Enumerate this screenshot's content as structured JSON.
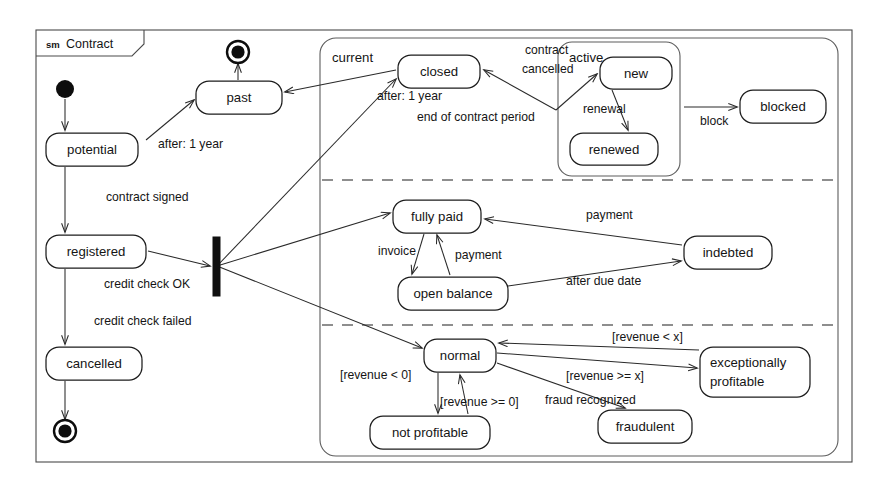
{
  "frame": {
    "kind": "sm",
    "name": "Contract",
    "x": 36,
    "y": 30,
    "w": 816,
    "h": 432,
    "tab_w": 108,
    "tab_h": 26
  },
  "composite": {
    "name": "current",
    "name_x": 332,
    "name_y": 62,
    "x": 320,
    "y": 38,
    "w": 518,
    "h": 418,
    "dividers": [
      180,
      325
    ]
  },
  "active_region": {
    "name": "active",
    "name_x": 569,
    "name_y": 62,
    "x": 558,
    "y": 42,
    "w": 122,
    "h": 134
  },
  "pseudostates": [
    {
      "name": "initial-node",
      "kind": "initial",
      "cx": 65,
      "cy": 89,
      "r": 9
    },
    {
      "name": "final-node-past",
      "kind": "final",
      "cx": 238,
      "cy": 52,
      "r": 11
    },
    {
      "name": "final-node-cancelled",
      "kind": "final",
      "cx": 65,
      "cy": 431,
      "r": 11
    },
    {
      "name": "fork-bar",
      "kind": "fork",
      "x": 213,
      "y": 237,
      "w": 7,
      "h": 59
    }
  ],
  "states": [
    {
      "id": "past",
      "label": "past",
      "x": 196,
      "y": 81,
      "w": 86,
      "h": 33
    },
    {
      "id": "potential",
      "label": "potential",
      "x": 46,
      "y": 133,
      "w": 92,
      "h": 33
    },
    {
      "id": "registered",
      "label": "registered",
      "x": 46,
      "y": 235,
      "w": 100,
      "h": 33
    },
    {
      "id": "cancelled",
      "label": "cancelled",
      "x": 46,
      "y": 347,
      "w": 96,
      "h": 33
    },
    {
      "id": "closed",
      "label": "closed",
      "x": 398,
      "y": 55,
      "w": 82,
      "h": 33
    },
    {
      "id": "new",
      "label": "new",
      "x": 600,
      "y": 57,
      "w": 72,
      "h": 32
    },
    {
      "id": "renewed",
      "label": "renewed",
      "x": 570,
      "y": 133,
      "w": 88,
      "h": 32
    },
    {
      "id": "blocked",
      "label": "blocked",
      "x": 740,
      "y": 90,
      "w": 86,
      "h": 33
    },
    {
      "id": "fully_paid",
      "label": "fully paid",
      "x": 393,
      "y": 200,
      "w": 88,
      "h": 33
    },
    {
      "id": "open_balance",
      "label": "open balance",
      "x": 398,
      "y": 277,
      "w": 110,
      "h": 33
    },
    {
      "id": "indebted",
      "label": "indebted",
      "x": 684,
      "y": 236,
      "w": 88,
      "h": 33
    },
    {
      "id": "normal",
      "label": "normal",
      "x": 424,
      "y": 339,
      "w": 72,
      "h": 33
    },
    {
      "id": "not_profitable",
      "label": "not profitable",
      "x": 370,
      "y": 416,
      "w": 120,
      "h": 33
    },
    {
      "id": "fraudulent",
      "label": "fraudulent",
      "x": 598,
      "y": 410,
      "w": 94,
      "h": 33
    },
    {
      "id": "exceptionally_profitable",
      "label_line1": "exceptionally",
      "label_line2": "profitable",
      "x": 700,
      "y": 347,
      "w": 110,
      "h": 50
    }
  ],
  "transition_labels": [
    {
      "id": "after_1_year",
      "text": "after: 1 year",
      "x": 158,
      "y": 148
    },
    {
      "id": "contract_signed",
      "text": "contract signed",
      "x": 106,
      "y": 201
    },
    {
      "id": "credit_check_ok",
      "text": "credit check OK",
      "x": 104,
      "y": 288
    },
    {
      "id": "credit_check_failed",
      "text": "credit check failed",
      "x": 94,
      "y": 325
    },
    {
      "id": "after_1_year_current",
      "text": "after: 1 year",
      "x": 377,
      "y": 100
    },
    {
      "id": "end_of_contract_period",
      "text": "end of contract period",
      "x": 417,
      "y": 121
    },
    {
      "id": "contract",
      "text": "contract",
      "x": 525,
      "y": 54
    },
    {
      "id": "cancelled_evt",
      "text": "cancelled",
      "x": 522,
      "y": 73
    },
    {
      "id": "renewal",
      "text": "renewal",
      "x": 583,
      "y": 113
    },
    {
      "id": "block",
      "text": "block",
      "x": 700,
      "y": 125
    },
    {
      "id": "invoice",
      "text": "invoice",
      "x": 378,
      "y": 255
    },
    {
      "id": "payment_ob",
      "text": "payment",
      "x": 455,
      "y": 259
    },
    {
      "id": "payment_ind",
      "text": "payment",
      "x": 586,
      "y": 219
    },
    {
      "id": "after_due_date",
      "text": "after due date",
      "x": 566,
      "y": 285
    },
    {
      "id": "revenue_lt_0",
      "text": "[revenue < 0]",
      "x": 340,
      "y": 379
    },
    {
      "id": "revenue_gte_0",
      "text": "[revenue >= 0]",
      "x": 440,
      "y": 406
    },
    {
      "id": "revenue_lt_x",
      "text": "[revenue < x]",
      "x": 612,
      "y": 341
    },
    {
      "id": "revenue_gte_x",
      "text": "[revenue >= x]",
      "x": 566,
      "y": 380
    },
    {
      "id": "fraud_recognized",
      "text": "fraud recognized",
      "x": 545,
      "y": 404
    }
  ],
  "edges": [
    {
      "id": "initial-to-potential",
      "d": "M 65 99 L 65 130",
      "arrow": true
    },
    {
      "id": "potential-to-past",
      "d": "M 146 140 L 194 100",
      "arrow": true
    },
    {
      "id": "potential-to-registered",
      "d": "M 65 167 L 65 232",
      "arrow": true
    },
    {
      "id": "past-to-final",
      "d": "M 238 80 L 238 64",
      "arrow": true
    },
    {
      "id": "registered-to-cancelled",
      "d": "M 65 269 L 65 344",
      "arrow": true
    },
    {
      "id": "cancelled-to-final",
      "d": "M 65 381 L 65 419",
      "arrow": true
    },
    {
      "id": "registered-to-fork",
      "d": "M 148 251 L 210 266",
      "arrow": true
    },
    {
      "id": "fork-to-closed",
      "d": "M 217 266 L 396 79",
      "arrow": true
    },
    {
      "id": "fork-to-fullypaid",
      "d": "M 217 266 L 390 213",
      "arrow": true
    },
    {
      "id": "fork-to-normal",
      "d": "M 217 266 L 422 348",
      "arrow": true
    },
    {
      "id": "closed-to-past",
      "d": "M 396 70 L 285 92",
      "arrow": true
    },
    {
      "id": "active-to-closed",
      "d": "M 556 110 L 484 70",
      "arrow": true
    },
    {
      "id": "closed-to-new",
      "d": "M 556 110 L 597 74",
      "arrow": true
    },
    {
      "id": "new-to-renewed",
      "d": "M 612 90 L 628 130",
      "arrow": true
    },
    {
      "id": "active-to-blocked",
      "d": "M 684 107 L 737 107",
      "arrow": true
    },
    {
      "id": "fullypaid-to-openbalance",
      "d": "M 424 234 L 412 274",
      "arrow": true
    },
    {
      "id": "openbalance-to-fullypaid",
      "d": "M 450 275 L 437 235",
      "arrow": true
    },
    {
      "id": "indebted-to-fullypaid",
      "d": "M 682 245 L 485 219",
      "arrow": true
    },
    {
      "id": "openbalance-to-indebted",
      "d": "M 508 286 L 681 261",
      "arrow": true
    },
    {
      "id": "normal-to-notprofitable",
      "d": "M 438 373 L 438 413",
      "arrow": true
    },
    {
      "id": "notprofitable-to-normal",
      "d": "M 468 414 L 460 375",
      "arrow": true
    },
    {
      "id": "normal-to-excprofitable",
      "d": "M 497 353 L 697 368",
      "arrow": true
    },
    {
      "id": "excprofitable-to-normal",
      "d": "M 699 350 L 499 343",
      "arrow": true
    },
    {
      "id": "normal-to-fraudulent",
      "d": "M 497 363 L 625 408",
      "arrow": true
    }
  ],
  "colors": {
    "ink": "#1d1d1d",
    "frame": "#4a4a4a",
    "region": "#5d5d5d",
    "divider": "#6a6a6a",
    "paper": "#ffffff"
  }
}
